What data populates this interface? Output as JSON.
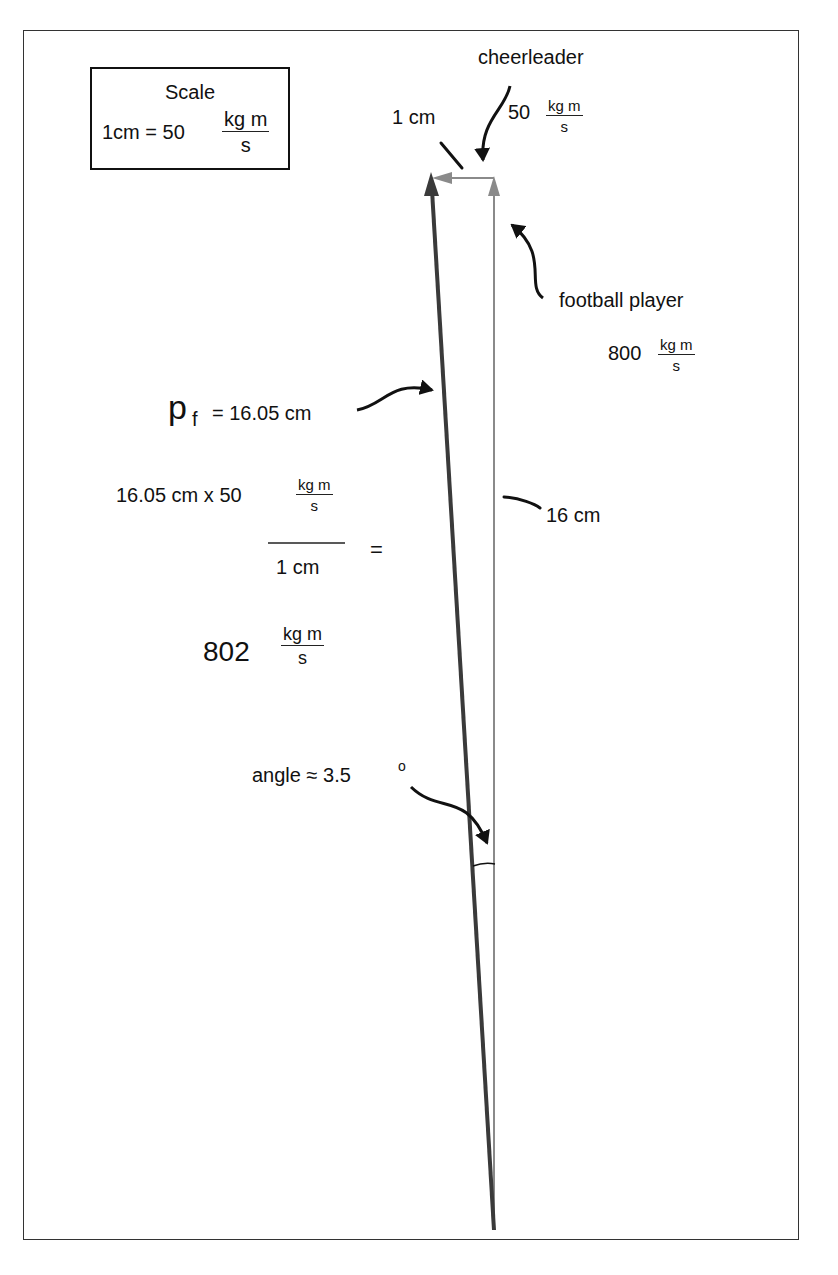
{
  "scale_box": {
    "title": "Scale",
    "equation_left": "1cm = 50",
    "unit_numerator": "kg m",
    "unit_denominator": "s"
  },
  "labels": {
    "cheerleader": {
      "name": "cheerleader",
      "value": "50",
      "unit_numerator": "kg m",
      "unit_denominator": "s"
    },
    "one_cm": "1 cm",
    "football_player": {
      "name": "football player",
      "value": "800",
      "unit_numerator": "kg m",
      "unit_denominator": "s"
    },
    "pf": {
      "symbol": "p",
      "subscript": "f",
      "equation": "= 16.05 cm"
    },
    "sixteen_cm": "16 cm",
    "calculation": {
      "numerator_text": "16.05 cm x 50",
      "unit_numerator": "kg m",
      "unit_denominator": "s",
      "denominator": "1 cm",
      "equals": "="
    },
    "result": {
      "value": "802",
      "unit_numerator": "kg m",
      "unit_denominator": "s"
    },
    "angle": {
      "text": "angle ≈ 3.5",
      "degree": "o"
    }
  },
  "vectors": {
    "football_player_color": "#8a8a8a",
    "cheerleader_color": "#8a8a8a",
    "resultant_color": "#3a3a3a"
  }
}
